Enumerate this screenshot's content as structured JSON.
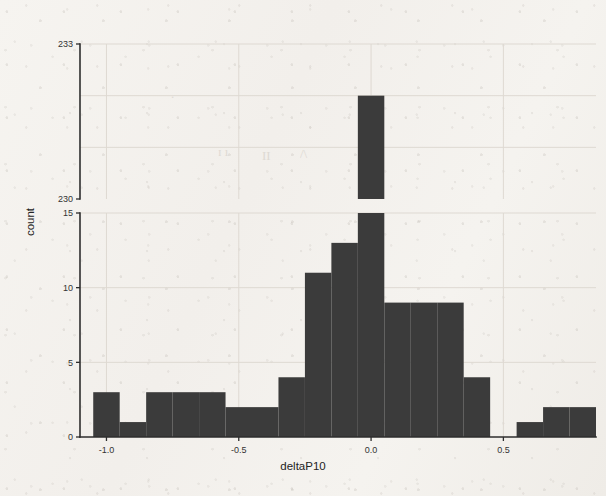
{
  "chart_data": {
    "type": "bar",
    "title": "",
    "xlabel": "deltaP10",
    "ylabel": "count",
    "grid": true,
    "legend": "none",
    "broken_axis": true,
    "bin_width": 0.1,
    "xlim": [
      -1.1,
      0.85
    ],
    "xticks": [
      -1.0,
      -0.5,
      0.0,
      0.5
    ],
    "xticklabels": [
      "-1.0",
      "-0.5",
      "0.0",
      "0.5"
    ],
    "lower_panel": {
      "ylim": [
        0,
        15
      ],
      "yticks": [
        0,
        5,
        10,
        15
      ],
      "yticklabels": [
        "0",
        "5",
        "10",
        "15"
      ]
    },
    "upper_panel": {
      "ylim": [
        230,
        233
      ],
      "yticks": [
        230,
        233
      ],
      "yticklabels": [
        "230",
        "233"
      ]
    },
    "bins": [
      {
        "x0": -1.05,
        "x1": -0.95,
        "value": 3
      },
      {
        "x0": -0.95,
        "x1": -0.85,
        "value": 1
      },
      {
        "x0": -0.85,
        "x1": -0.75,
        "value": 3
      },
      {
        "x0": -0.75,
        "x1": -0.65,
        "value": 3
      },
      {
        "x0": -0.65,
        "x1": -0.55,
        "value": 3
      },
      {
        "x0": -0.55,
        "x1": -0.45,
        "value": 2
      },
      {
        "x0": -0.45,
        "x1": -0.35,
        "value": 2
      },
      {
        "x0": -0.35,
        "x1": -0.25,
        "value": 4
      },
      {
        "x0": -0.25,
        "x1": -0.15,
        "value": 11
      },
      {
        "x0": -0.15,
        "x1": -0.05,
        "value": 13
      },
      {
        "x0": -0.05,
        "x1": 0.05,
        "value": 232
      },
      {
        "x0": 0.05,
        "x1": 0.15,
        "value": 9
      },
      {
        "x0": 0.15,
        "x1": 0.25,
        "value": 9
      },
      {
        "x0": 0.25,
        "x1": 0.35,
        "value": 9
      },
      {
        "x0": 0.35,
        "x1": 0.45,
        "value": 4
      },
      {
        "x0": 0.45,
        "x1": 0.55,
        "value": 0
      },
      {
        "x0": 0.55,
        "x1": 0.65,
        "value": 1
      },
      {
        "x0": 0.65,
        "x1": 0.75,
        "value": 2
      },
      {
        "x0": 0.75,
        "x1": 0.85,
        "value": 2
      }
    ],
    "colors": {
      "bar": "#3b3b3b",
      "axis": "#2e2e2e",
      "grid": "#ded9d2",
      "background": "#f4f2ee"
    }
  }
}
